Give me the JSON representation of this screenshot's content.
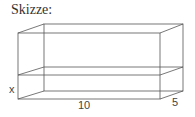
{
  "title": "Skizze:",
  "labels": {
    "height": "x",
    "length": "10",
    "depth": "5"
  },
  "colors": {
    "line": "#555555",
    "text": "#333333",
    "background": "#ffffff"
  }
}
